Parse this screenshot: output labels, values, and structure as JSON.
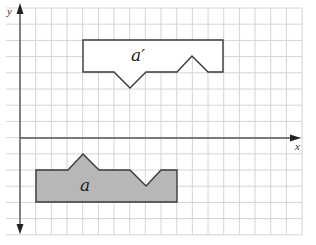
{
  "diagram": {
    "type": "translation-on-grid",
    "axes": {
      "x_label": "x",
      "y_label": "y"
    },
    "grid": {
      "columns": 18,
      "rows_above_x_axis": 8,
      "rows_below_x_axis": 6
    },
    "shapes": [
      {
        "id": "a",
        "label": "a",
        "style": "filled",
        "fill": "#b7b7b7",
        "stroke": "#3a3a3a",
        "vertices_grid": [
          [
            1,
            -2
          ],
          [
            3,
            -2
          ],
          [
            4,
            -1
          ],
          [
            5,
            -2
          ],
          [
            7,
            -2
          ],
          [
            8,
            -3
          ],
          [
            9,
            -2
          ],
          [
            10,
            -2
          ],
          [
            10,
            -4
          ],
          [
            1,
            -4
          ]
        ]
      },
      {
        "id": "a-prime",
        "label": "a′",
        "style": "outline",
        "fill": "#ffffff",
        "stroke": "#3a3a3a",
        "vertices_grid": [
          [
            4,
            6
          ],
          [
            13,
            6
          ],
          [
            13,
            4
          ],
          [
            12,
            4
          ],
          [
            11,
            5
          ],
          [
            10,
            4
          ],
          [
            8,
            4
          ],
          [
            7,
            3
          ],
          [
            6,
            4
          ],
          [
            4,
            4
          ]
        ]
      }
    ],
    "colors": {
      "grid": "#d4d4d4",
      "axis": "#555555"
    }
  }
}
